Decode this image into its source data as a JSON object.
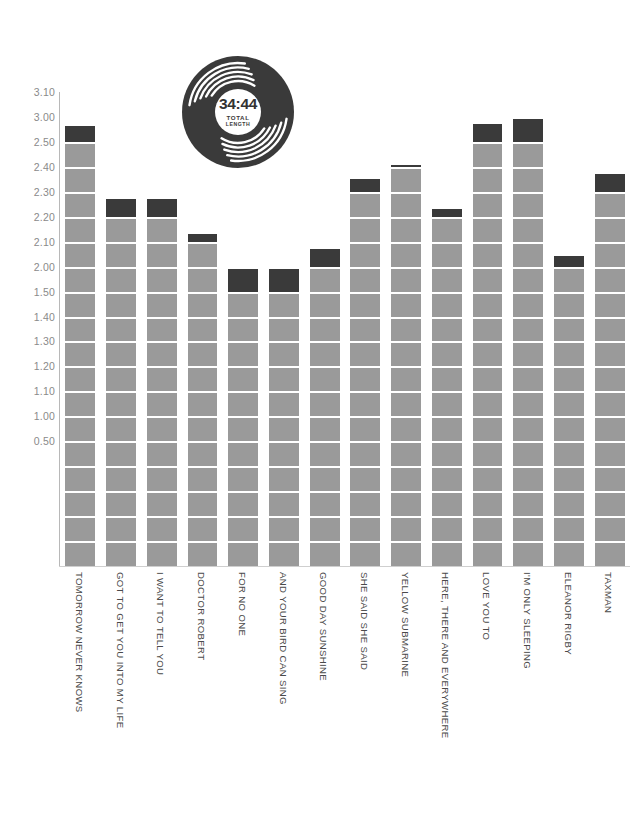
{
  "chart_data": {
    "type": "bar",
    "title": "",
    "subtitle": "",
    "xlabel": "",
    "ylabel": "",
    "grid": false,
    "legend": "none",
    "note": "Stacked bar chart of Beatles 'Revolver' track lengths. Y axis is minutes.seconds (m.ss); each bar is drawn as stacked 10-second blocks, the topmost partial block rendered in dark charcoal.",
    "y_tick_labels": [
      "3.10",
      "3.00",
      "2.50",
      "2.40",
      "2.30",
      "2.20",
      "2.10",
      "2.00",
      "1.50",
      "1.40",
      "1.30",
      "1.20",
      "1.10",
      "1.00",
      "0.50"
    ],
    "y_tick_seconds": [
      190,
      180,
      170,
      160,
      150,
      140,
      130,
      120,
      110,
      100,
      90,
      80,
      70,
      60,
      50
    ],
    "ylim_seconds": [
      0,
      190
    ],
    "categories": [
      "TOMORROW NEVER KNOWS",
      "GOT TO GET YOU INTO MY LIFE",
      "I WANT TO TELL YOU",
      "DOCTOR ROBERT",
      "FOR NO ONE",
      "AND YOUR BIRD CAN SING",
      "GOOD DAY SUNSHINE",
      "SHE SAID SHE SAID",
      "YELLOW SUBMARINE",
      "HERE, THERE AND EVERYWHERE",
      "LOVE YOU TO",
      "I'M ONLY SLEEPING",
      "ELEANOR RIGBY",
      "TAXMAN"
    ],
    "value_labels": [
      "2.57",
      "2.28",
      "2.28",
      "2.14",
      "2.00",
      "2.00",
      "2.08",
      "2.36",
      "2.41",
      "2.24",
      "2.58",
      "3.00",
      "2.05",
      "2.38"
    ],
    "values_seconds": [
      177,
      148,
      148,
      134,
      120,
      120,
      128,
      156,
      161,
      144,
      178,
      180,
      125,
      158
    ]
  },
  "vinyl": {
    "total_time": "34:44",
    "label_line1": "TOTAL",
    "label_line2": "LENGTH"
  },
  "colors": {
    "bar_fill": "#9a9a9a",
    "bar_top_fill": "#3a3a3a",
    "axis": "#b8b8b8",
    "tick_text": "#8a8a8a",
    "category_text": "#4a4a4a",
    "background": "#ffffff"
  }
}
